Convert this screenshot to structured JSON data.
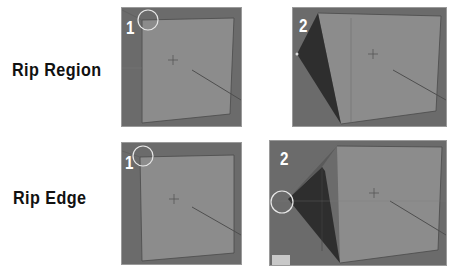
{
  "labels": {
    "rip_region": "Rip Region",
    "rip_edge": "Rip Edge"
  },
  "panels": [
    {
      "step": "1",
      "row": "rip_region",
      "description": "Cube with selected vertex highlighted by circle at top-left"
    },
    {
      "step": "2",
      "row": "rip_region",
      "description": "Cube with ripped region pulled out to the left, dark triangular face revealed"
    },
    {
      "step": "1",
      "row": "rip_edge",
      "description": "Cube with selected vertex highlighted by circle at top-left"
    },
    {
      "step": "2",
      "row": "rip_edge",
      "description": "Cube with ripped edge dragged left, circle on dragged vertex, dark triangular gap"
    }
  ],
  "colors": {
    "viewport_bg": "#6b6b6b",
    "cube_face": "#8c8c8c",
    "rip_shadow": "#2e2e2e",
    "highlight_circle": "#e8e8e8",
    "label_text": "#111111"
  }
}
